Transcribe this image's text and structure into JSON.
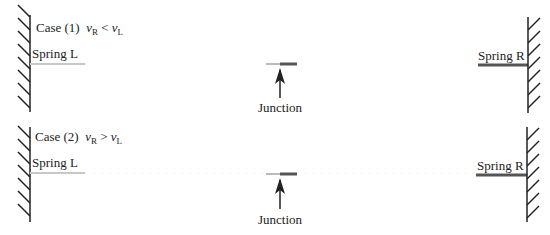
{
  "panels": [
    {
      "case_label": "Case (1)",
      "condition": {
        "lhs": "v",
        "lhs_sub": "R",
        "op": "<",
        "rhs": "v",
        "rhs_sub": "L"
      },
      "spring_left_label": "Spring L",
      "spring_right_label": "Spring R",
      "junction_label": "Junction"
    },
    {
      "case_label": "Case (2)",
      "condition": {
        "lhs": "v",
        "lhs_sub": "R",
        "op": ">",
        "rhs": "v",
        "rhs_sub": "L"
      },
      "spring_left_label": "Spring L",
      "spring_right_label": "Spring R",
      "junction_label": "Junction"
    }
  ],
  "colors": {
    "wall": "#222222",
    "spring_left": "#c8c8c8",
    "spring_right": "#555555",
    "arrow": "#222222"
  }
}
